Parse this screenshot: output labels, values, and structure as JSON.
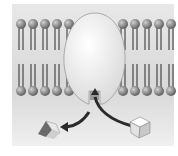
{
  "diagram": {
    "colors": {
      "background_top": "#e4e4e4",
      "background_bottom": "#f2f2f2",
      "lipid_head": "#8a8a8a",
      "lipid_tail": "#2a2a2a",
      "protein": "#f0f0f0",
      "arrow": "#2a2a2a",
      "cube": "#f4f4f4",
      "prism": "#7a7a7a"
    },
    "lipid_heads_left_count": 5,
    "lipid_heads_right_count": 5,
    "labels": []
  }
}
